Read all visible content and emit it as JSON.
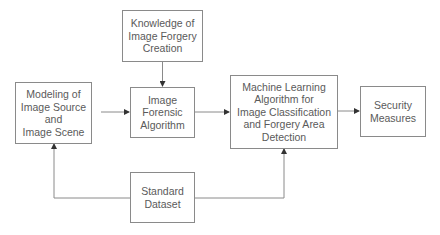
{
  "diagram": {
    "nodes": [
      {
        "id": "knowledge",
        "label": "Knowledge of Image Forgery Creation",
        "lines": [
          "Knowledge of",
          "Image Forgery",
          "Creation"
        ]
      },
      {
        "id": "modeling",
        "label": "Modeling of Image Source and Image Scene",
        "lines": [
          "Modeling of",
          "Image Source",
          "and",
          "Image Scene"
        ]
      },
      {
        "id": "forensic",
        "label": "Image Forensic Algorithm",
        "lines": [
          "Image",
          "Forensic",
          "Algorithm"
        ]
      },
      {
        "id": "ml",
        "label": "Machine Learning Algorithm for Image Classification and Forgery Area Detection",
        "lines": [
          "Machine Learning",
          "Algorithm for",
          "Image Classification",
          "and Forgery Area",
          "Detection"
        ]
      },
      {
        "id": "security",
        "label": "Security Measures",
        "lines": [
          "Security",
          "Measures"
        ]
      },
      {
        "id": "dataset",
        "label": "Standard Dataset",
        "lines": [
          "Standard",
          "Dataset"
        ]
      }
    ],
    "edges": [
      {
        "from": "knowledge",
        "to": "forensic"
      },
      {
        "from": "modeling",
        "to": "forensic"
      },
      {
        "from": "forensic",
        "to": "ml"
      },
      {
        "from": "ml",
        "to": "security"
      },
      {
        "from": "dataset",
        "to": "modeling"
      },
      {
        "from": "dataset",
        "to": "ml"
      }
    ]
  }
}
